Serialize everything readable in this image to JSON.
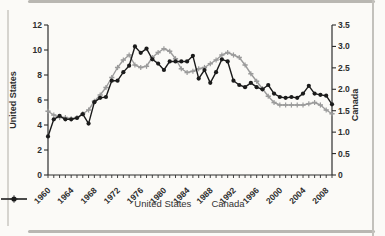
{
  "figure": {
    "type_note": "dual-axis line chart, scanned figure"
  },
  "colors": {
    "us_line": "#9b9b9b",
    "canada_line": "#1b1b1b",
    "axis": "#2e2e2e",
    "text": "#2e2e2e",
    "scan_rule": "#b9b7b2",
    "background": "#fbfaf7"
  },
  "legend": {
    "us_label": "United States",
    "canada_label": "Canada"
  },
  "chart_data": {
    "type": "line",
    "title": "",
    "x_start_year": 1960,
    "x_end_year": 2009,
    "x_label_every": 4,
    "x_tick_labels": [
      "1960",
      "1964",
      "1968",
      "1972",
      "1976",
      "1980",
      "1984",
      "1988",
      "1992",
      "1996",
      "2000",
      "2004",
      "2008"
    ],
    "left_axis": {
      "title": "United States",
      "min": 0,
      "max": 12,
      "ticks": [
        "0",
        "2",
        "4",
        "6",
        "8",
        "10",
        "12"
      ]
    },
    "right_axis": {
      "title": "Canada",
      "min": 0,
      "max": 3.5,
      "ticks": [
        "0",
        "0.5",
        "1.0",
        "1.5",
        "2.0",
        "2.5",
        "3.0",
        "3.5"
      ]
    },
    "legend_position": "bottom",
    "grid": false,
    "series": [
      {
        "name": "United States",
        "axis": "left",
        "color": "#9b9b9b",
        "marker": "cross",
        "values": [
          5.1,
          4.8,
          4.6,
          4.6,
          4.5,
          4.6,
          4.9,
          5.2,
          5.9,
          6.4,
          7.0,
          7.8,
          8.6,
          9.2,
          9.6,
          8.8,
          8.6,
          8.7,
          9.4,
          9.8,
          10.1,
          9.9,
          9.3,
          8.5,
          8.2,
          8.3,
          8.5,
          8.6,
          8.9,
          9.2,
          9.6,
          9.8,
          9.6,
          9.4,
          8.8,
          8.1,
          7.5,
          6.9,
          6.3,
          5.8,
          5.6,
          5.6,
          5.6,
          5.6,
          5.6,
          5.7,
          5.8,
          5.6,
          5.2,
          4.9
        ]
      },
      {
        "name": "Canada",
        "axis": "right",
        "color": "#1b1b1b",
        "marker": "circle",
        "values": [
          0.9,
          1.3,
          1.38,
          1.3,
          1.3,
          1.33,
          1.42,
          1.2,
          1.7,
          1.8,
          1.82,
          2.2,
          2.2,
          2.4,
          2.55,
          3.0,
          2.85,
          2.95,
          2.7,
          2.6,
          2.45,
          2.65,
          2.65,
          2.65,
          2.65,
          2.78,
          2.25,
          2.45,
          2.15,
          2.4,
          2.7,
          2.65,
          2.2,
          2.1,
          2.05,
          2.15,
          2.05,
          2.0,
          2.1,
          1.9,
          1.82,
          1.8,
          1.82,
          1.8,
          1.9,
          2.08,
          1.9,
          1.87,
          1.85,
          1.65
        ]
      }
    ]
  }
}
